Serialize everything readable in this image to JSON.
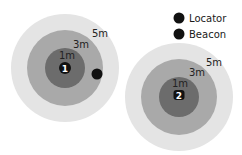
{
  "colors": {
    "ring_5m": "#e4e4e4",
    "ring_3m": "#a9a9a9",
    "ring_1m": "#6c6c6c",
    "marker": "#111111",
    "text": "#222222"
  },
  "legend": {
    "items": [
      {
        "label": "Locator",
        "symbol": "filled-circle"
      },
      {
        "label": "Beacon",
        "symbol": "filled-circle"
      }
    ]
  },
  "zones": [
    {
      "id_label": "1",
      "ring_labels": {
        "outer": "5m",
        "middle": "3m",
        "inner": "1m"
      }
    },
    {
      "id_label": "2",
      "ring_labels": {
        "outer": "5m",
        "middle": "3m",
        "inner": "1m"
      }
    }
  ]
}
